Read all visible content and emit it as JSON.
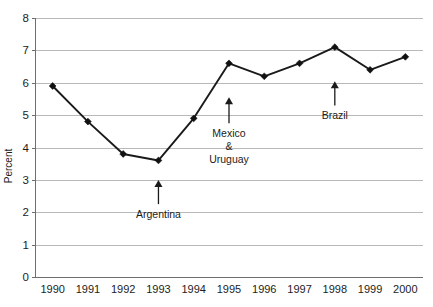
{
  "chart_data": {
    "type": "line",
    "title": "",
    "xlabel": "",
    "ylabel": "Percent",
    "ylim": [
      0,
      8
    ],
    "grid": true,
    "legend": "none",
    "categories": [
      "1990",
      "1991",
      "1992",
      "1993",
      "1994",
      "1995",
      "1996",
      "1997",
      "1998",
      "1999",
      "2000"
    ],
    "x": [
      1990,
      1991,
      1992,
      1993,
      1994,
      1995,
      1996,
      1997,
      1998,
      1999,
      2000
    ],
    "values": [
      5.9,
      4.8,
      3.8,
      3.6,
      4.9,
      6.6,
      6.2,
      6.6,
      7.1,
      6.4,
      6.8
    ],
    "series": [
      {
        "name": "Percent",
        "values": [
          5.9,
          4.8,
          3.8,
          3.6,
          4.9,
          6.6,
          6.2,
          6.6,
          7.1,
          6.4,
          6.8
        ]
      }
    ],
    "y_ticks": [
      "0",
      "1",
      "2",
      "3",
      "4",
      "5",
      "6",
      "7",
      "8"
    ],
    "y_tick_values": [
      0,
      1,
      2,
      3,
      4,
      5,
      6,
      7,
      8
    ],
    "annotations": [
      {
        "id": "argentina",
        "lines": [
          "Argentina"
        ],
        "x_value": 1993,
        "arrow_tip_value": 3.0,
        "arrow_base_value": 2.25
      },
      {
        "id": "mexico-uruguay",
        "lines": [
          "Mexico",
          "&",
          "Uruguay"
        ],
        "x_value": 1995,
        "arrow_tip_value": 5.55,
        "arrow_base_value": 4.75
      },
      {
        "id": "brazil",
        "lines": [
          "Brazil"
        ],
        "x_value": 1998,
        "arrow_tip_value": 6.05,
        "arrow_base_value": 5.3
      }
    ],
    "colors": {
      "line": "#1a1a1a",
      "marker": "#111111",
      "grid": "#b9b9b9",
      "axis": "#6e6e6e",
      "text": "#1c1c1c",
      "background": "#ffffff"
    }
  }
}
